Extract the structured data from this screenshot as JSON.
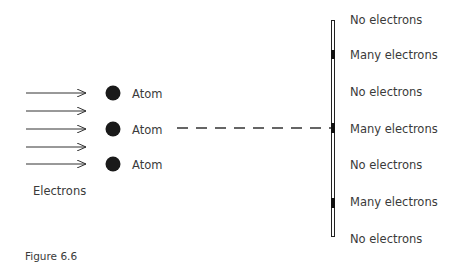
{
  "figure": {
    "caption": "Figure 6.6",
    "source_label": "Electrons",
    "atoms": [
      {
        "label": "Atom"
      },
      {
        "label": "Atom"
      },
      {
        "label": "Atom"
      }
    ],
    "screen_labels": [
      {
        "label": "No electrons"
      },
      {
        "label": "Many electrons"
      },
      {
        "label": "No electrons"
      },
      {
        "label": "Many electrons"
      },
      {
        "label": "No electrons"
      },
      {
        "label": "Many electrons"
      },
      {
        "label": "No electrons"
      }
    ],
    "colors": {
      "ink": "#1a1a1a",
      "text": "#3a3a3a"
    }
  }
}
